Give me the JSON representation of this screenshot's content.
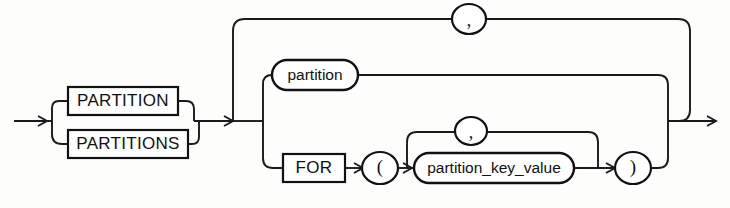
{
  "diagram": {
    "name": "partition-extension-clause",
    "type": "railroad-syntax-diagram",
    "background_color": "#fdfdfc",
    "line_color": "#1a1a1a",
    "entry_arrow": "entry-arrow",
    "exit_arrow": "exit-arrow"
  },
  "keywords": {
    "partition": "PARTITION",
    "partitions": "PARTITIONS",
    "for": "FOR"
  },
  "nonterminals": {
    "partition": "partition",
    "partition_key_value": "partition_key_value"
  },
  "punctuation": {
    "lparen": "(",
    "rparen": ")",
    "comma_outer": ",",
    "comma_inner": ","
  },
  "icons": {
    "entry": "arrow-right-icon",
    "exit": "arrow-right-icon",
    "loop_outer": "arrow-left-icon",
    "loop_inner": "arrow-left-icon"
  }
}
